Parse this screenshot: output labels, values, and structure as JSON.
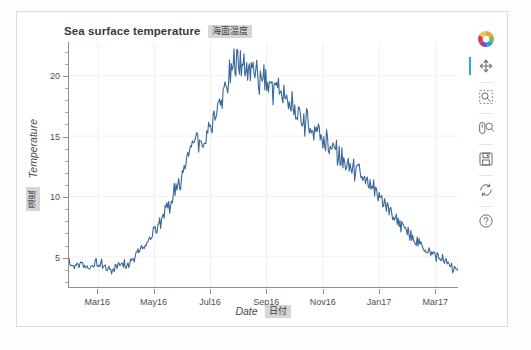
{
  "figure": {
    "title": "Sea surface temperature",
    "title_badge_jp": "海面温度",
    "background": "#ffffff",
    "border_color": "#dcdcdc"
  },
  "chart_data": {
    "type": "line",
    "title": "Sea surface temperature",
    "xlabel": "Date",
    "xlabel_jp": "日付",
    "ylabel": "Temperature",
    "ylabel_jp": "温度",
    "line_color": "#3a6898",
    "grid": true,
    "legend": null,
    "xtick_labels": [
      "Mar16",
      "May16",
      "Jul16",
      "Sep16",
      "Nov16",
      "Jan17",
      "Mar17"
    ],
    "ytick_labels": [
      "5",
      "10",
      "15",
      "20"
    ],
    "ytick_values": [
      5,
      10,
      15,
      20
    ],
    "ylim": [
      2.5,
      22.8
    ],
    "xlim": [
      "2016-02-10",
      "2017-04-05"
    ],
    "series": [
      {
        "name": "Sea surface temperature",
        "color": "#3a6898",
        "x": [
          "2016-02-10",
          "2016-02-17",
          "2016-02-24",
          "2016-03-02",
          "2016-03-09",
          "2016-03-16",
          "2016-03-23",
          "2016-03-30",
          "2016-04-06",
          "2016-04-13",
          "2016-04-20",
          "2016-04-27",
          "2016-05-04",
          "2016-05-11",
          "2016-05-18",
          "2016-05-25",
          "2016-06-01",
          "2016-06-08",
          "2016-06-15",
          "2016-06-22",
          "2016-06-29",
          "2016-07-06",
          "2016-07-13",
          "2016-07-20",
          "2016-07-27",
          "2016-08-03",
          "2016-08-10",
          "2016-08-17",
          "2016-08-24",
          "2016-08-31",
          "2016-09-07",
          "2016-09-14",
          "2016-09-21",
          "2016-09-28",
          "2016-10-05",
          "2016-10-12",
          "2016-10-19",
          "2016-10-26",
          "2016-11-02",
          "2016-11-09",
          "2016-11-16",
          "2016-11-23",
          "2016-11-30",
          "2016-12-07",
          "2016-12-14",
          "2016-12-21",
          "2016-12-28",
          "2017-01-04",
          "2017-01-11",
          "2017-01-18",
          "2017-01-25",
          "2017-02-01",
          "2017-02-08",
          "2017-02-15",
          "2017-02-22",
          "2017-03-01",
          "2017-03-08",
          "2017-03-15",
          "2017-03-22",
          "2017-03-29"
        ],
        "values": [
          4.5,
          4.2,
          4.3,
          4.1,
          4.5,
          4.3,
          4.0,
          4.2,
          4.6,
          4.5,
          5.2,
          6.0,
          6.3,
          7.1,
          8.2,
          9.3,
          10.2,
          11.5,
          13.4,
          14.6,
          13.9,
          15.1,
          16.3,
          17.8,
          19.4,
          20.9,
          21.4,
          20.1,
          20.6,
          19.8,
          19.3,
          19.0,
          18.6,
          18.2,
          17.1,
          16.4,
          15.9,
          15.6,
          15.3,
          14.6,
          14.0,
          13.2,
          12.6,
          12.3,
          11.8,
          11.2,
          10.6,
          10.0,
          9.3,
          8.6,
          8.0,
          7.2,
          6.6,
          6.1,
          5.6,
          5.2,
          5.0,
          4.6,
          4.2,
          3.6
        ]
      }
    ]
  },
  "toolbar": {
    "logo_label": "bokeh-logo",
    "tools": [
      {
        "name": "pan-tool",
        "label": "Pan",
        "active": true
      },
      {
        "name": "box-zoom-tool",
        "label": "Box Zoom",
        "active": false
      },
      {
        "name": "wheel-zoom-tool",
        "label": "Wheel Zoom",
        "active": false
      },
      {
        "name": "save-tool",
        "label": "Save",
        "active": false
      },
      {
        "name": "reset-tool",
        "label": "Reset",
        "active": false
      },
      {
        "name": "help-tool",
        "label": "Help",
        "active": false
      }
    ]
  }
}
